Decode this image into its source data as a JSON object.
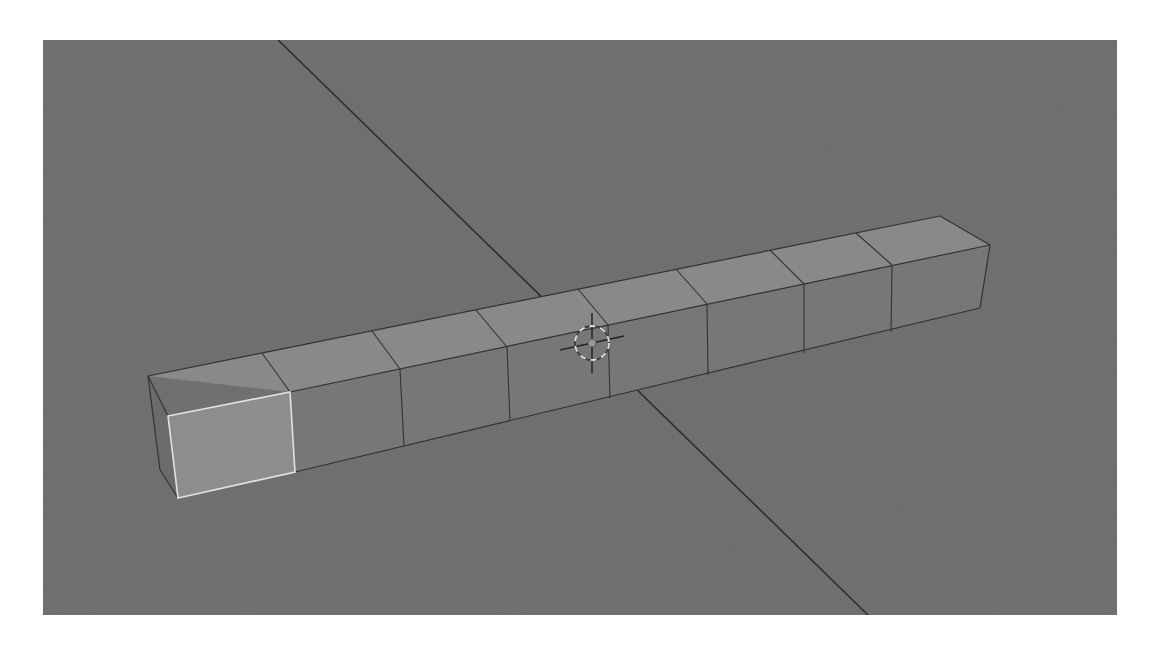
{
  "viewport": {
    "name": "3d-viewport",
    "background": "#6f6f6f",
    "bounds": {
      "x": 43,
      "y": 40,
      "width": 1074,
      "height": 575
    }
  },
  "colors": {
    "grid_axis_line": "#2a2a2a",
    "top_face": "#8a8a8a",
    "front_face": "#777777",
    "side_face": "#6a6a6a",
    "selected_face": "#8e8e8e",
    "edge": "#2e2e2e",
    "selected_edge": "#e8e8e8",
    "cursor_ring_light": "#e6e6e6",
    "cursor_ring_dark": "#3a3a3a",
    "cursor_cross": "#1e1e1e"
  },
  "scene": {
    "object": "beam-of-cubes",
    "segment_count": 8,
    "selected_segment": 1,
    "selected_face": "front-end-face",
    "axis_lines": [
      {
        "name": "axis-line-y",
        "x1": 278,
        "y1": 40,
        "x2": 868,
        "y2": 615
      }
    ],
    "cursor": {
      "name": "3d-cursor",
      "x": 592,
      "y": 343
    }
  }
}
